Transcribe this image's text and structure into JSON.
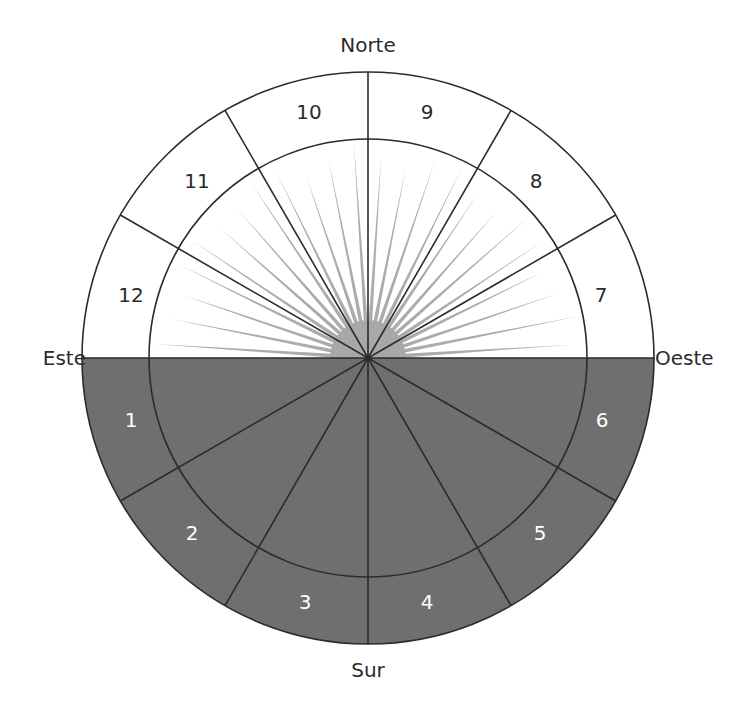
{
  "diagram": {
    "center": {
      "x": 368,
      "y": 358
    },
    "outer_radius": 286,
    "inner_radius": 219,
    "colors": {
      "line": "#2b2b2b",
      "lower_fill": "#6f6f6f",
      "upper_fill": "#ffffff",
      "ray": "#a8a8a8",
      "upper_label": "#2b2b2b",
      "lower_label": "#ffffff"
    },
    "directions": {
      "north": "Norte",
      "south": "Sur",
      "east": "Este",
      "west": "Oeste"
    },
    "sectors": [
      {
        "label": "1",
        "x": 131,
        "y": 420
      },
      {
        "label": "2",
        "x": 192,
        "y": 533
      },
      {
        "label": "3",
        "x": 305,
        "y": 602
      },
      {
        "label": "4",
        "x": 427,
        "y": 602
      },
      {
        "label": "5",
        "x": 540,
        "y": 533
      },
      {
        "label": "6",
        "x": 602,
        "y": 420
      },
      {
        "label": "7",
        "x": 601,
        "y": 295
      },
      {
        "label": "8",
        "x": 536,
        "y": 181
      },
      {
        "label": "9",
        "x": 427,
        "y": 112
      },
      {
        "label": "10",
        "x": 309,
        "y": 112
      },
      {
        "label": "11",
        "x": 197,
        "y": 181
      },
      {
        "label": "12",
        "x": 131,
        "y": 295
      }
    ],
    "rays_count": 24
  }
}
